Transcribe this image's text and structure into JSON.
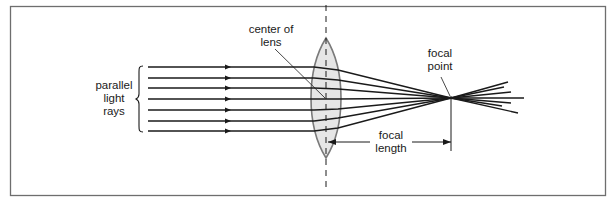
{
  "diagram": {
    "type": "optics-converging-lens",
    "labels": {
      "parallel_rays": [
        "parallel",
        "light",
        "rays"
      ],
      "center_of_lens": [
        "center of",
        "lens"
      ],
      "focal_point": [
        "focal",
        "point"
      ],
      "focal_length": [
        "focal",
        "length"
      ]
    },
    "colors": {
      "frame": "#6e6e6e",
      "ink": "#1a1a1a",
      "lens_fill": "#e6e6e6",
      "lens_stroke": "#7a7a7a"
    },
    "ray_count": 7
  }
}
